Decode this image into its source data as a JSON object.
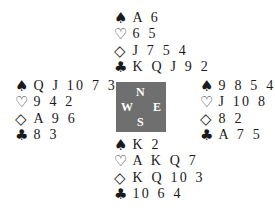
{
  "suits": {
    "spades": "♠",
    "hearts": "♡",
    "diamonds": "◇",
    "clubs": "♣"
  },
  "compass": {
    "north": "N",
    "east": "E",
    "south": "S",
    "west": "W",
    "background_color": "#6f6f6f"
  },
  "hands": {
    "north": {
      "spades": "A 6",
      "hearts": "6 5",
      "diamonds": "J 7 5 4",
      "clubs": "K Q J 9 2"
    },
    "west": {
      "spades": "Q J 10 7 3",
      "hearts": "9 4 2",
      "diamonds": "A 9 6",
      "clubs": "8 3"
    },
    "east": {
      "spades": "9 8 5 4",
      "hearts": "J 10 8 3",
      "diamonds": "8 2",
      "clubs": "A 7 5"
    },
    "south": {
      "spades": "K 2",
      "hearts": "A K Q 7",
      "diamonds": "K Q 10 3",
      "clubs": "10 6 4"
    }
  }
}
